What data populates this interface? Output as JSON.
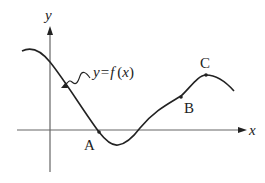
{
  "diagram": {
    "title": "",
    "axes": {
      "x_label": "x",
      "y_label": "y",
      "axis_color": "#555555"
    },
    "curve": {
      "label": "y = f (x)",
      "label_parts": [
        "y",
        "=",
        "f",
        "(",
        "x",
        ")"
      ],
      "color": "#222222",
      "shape": "wave: descends from upper-left, crosses y-axis, local minimum just below x-axis, rises to local maximum C, then descends"
    },
    "points": [
      {
        "name": "A",
        "description": "on the curve just below the x-axis, descending side before the minimum"
      },
      {
        "name": "B",
        "description": "on the rising part of the curve before the maximum"
      },
      {
        "name": "C",
        "description": "local maximum of the curve"
      }
    ]
  }
}
